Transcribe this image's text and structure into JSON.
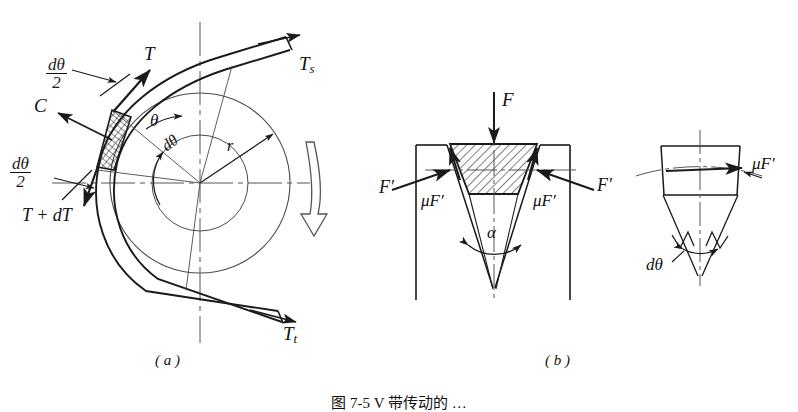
{
  "figure": {
    "caption": "图 7-5  V 带传动的 …",
    "panels": [
      {
        "key": "a",
        "label": "( a )",
        "title": "belt-friction-free-body"
      },
      {
        "key": "b",
        "label": "( b )",
        "title": "v-belt-groove-forces"
      }
    ]
  },
  "panel_a": {
    "labels": {
      "tension_slack": "T",
      "tension_slack_sub": "s",
      "tension_tight": "T",
      "tension_tight_sub": "t",
      "tension_element": "T",
      "tension_increment": "T + dT",
      "centrifugal": "C",
      "radius": "r",
      "angle_theta": "θ",
      "angle_dtheta": "dθ",
      "half_angle_num": "dθ",
      "half_angle_den": "2"
    },
    "panel_label": "( a )"
  },
  "panel_b": {
    "left_view": {
      "normal_force": "F",
      "side_force_left": "F′",
      "side_force_right": "F′",
      "friction_left": "μF′",
      "friction_right": "μF′",
      "groove_angle": "α"
    },
    "right_view": {
      "friction": "μF′",
      "element_angle": "dθ"
    },
    "panel_label": "( b )"
  },
  "style": {
    "line_color": "#1a1a1a",
    "hatch_color": "#1a1a1a",
    "background": "#ffffff",
    "centerline_color": "#555555"
  }
}
